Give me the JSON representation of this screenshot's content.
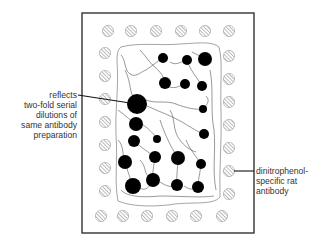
{
  "diagram": {
    "type": "membrane-immunoblot-schematic",
    "colors": {
      "frame": "#333333",
      "blot": "#000000",
      "hatch": "#888888",
      "outline": "#555555",
      "text": "#333333"
    },
    "frame": {
      "x": 82,
      "y": 13,
      "width": 172,
      "height": 220
    },
    "annotations": {
      "left": {
        "lines": [
          "reflects",
          "two-fold serial",
          "dilutions of",
          "same antibody",
          "preparation"
        ],
        "pointer": {
          "x1": 78,
          "y1": 95,
          "x2": 130,
          "y2": 103
        },
        "target": "large-black-spot"
      },
      "right": {
        "lines": [
          "dinitrophenol-",
          "specific rat",
          "antibody"
        ],
        "pointer": {
          "x1": 234,
          "y1": 171,
          "x2": 254,
          "y2": 171
        },
        "target": "hatched-reference-dot"
      }
    },
    "reference_dots": [
      {
        "x": 108,
        "y": 31
      },
      {
        "x": 131,
        "y": 31
      },
      {
        "x": 156,
        "y": 31
      },
      {
        "x": 181,
        "y": 31
      },
      {
        "x": 205,
        "y": 31
      },
      {
        "x": 229,
        "y": 31
      },
      {
        "x": 105,
        "y": 53
      },
      {
        "x": 105,
        "y": 76
      },
      {
        "x": 105,
        "y": 99
      },
      {
        "x": 105,
        "y": 122
      },
      {
        "x": 105,
        "y": 145
      },
      {
        "x": 105,
        "y": 168
      },
      {
        "x": 105,
        "y": 191
      },
      {
        "x": 229,
        "y": 56
      },
      {
        "x": 229,
        "y": 79
      },
      {
        "x": 229,
        "y": 102
      },
      {
        "x": 229,
        "y": 125
      },
      {
        "x": 229,
        "y": 148
      },
      {
        "x": 229,
        "y": 171
      },
      {
        "x": 229,
        "y": 194
      },
      {
        "x": 101,
        "y": 216
      },
      {
        "x": 123,
        "y": 216
      },
      {
        "x": 147,
        "y": 216
      },
      {
        "x": 172,
        "y": 216
      },
      {
        "x": 196,
        "y": 216
      },
      {
        "x": 222,
        "y": 216
      }
    ],
    "spots": [
      {
        "x": 163,
        "y": 58,
        "r": 5
      },
      {
        "x": 187,
        "y": 60,
        "r": 5
      },
      {
        "x": 205,
        "y": 59,
        "r": 7
      },
      {
        "x": 165,
        "y": 83,
        "r": 6
      },
      {
        "x": 185,
        "y": 84,
        "r": 5
      },
      {
        "x": 202,
        "y": 86,
        "r": 5
      },
      {
        "x": 137,
        "y": 104,
        "r": 10
      },
      {
        "x": 203,
        "y": 109,
        "r": 4
      },
      {
        "x": 136,
        "y": 124,
        "r": 7
      },
      {
        "x": 204,
        "y": 134,
        "r": 5
      },
      {
        "x": 134,
        "y": 141,
        "r": 6
      },
      {
        "x": 157,
        "y": 139,
        "r": 4
      },
      {
        "x": 125,
        "y": 162,
        "r": 7
      },
      {
        "x": 155,
        "y": 157,
        "r": 6
      },
      {
        "x": 178,
        "y": 158,
        "r": 7
      },
      {
        "x": 201,
        "y": 164,
        "r": 5
      },
      {
        "x": 133,
        "y": 186,
        "r": 8
      },
      {
        "x": 153,
        "y": 180,
        "r": 7
      },
      {
        "x": 177,
        "y": 185,
        "r": 6
      },
      {
        "x": 198,
        "y": 187,
        "r": 6
      }
    ]
  }
}
